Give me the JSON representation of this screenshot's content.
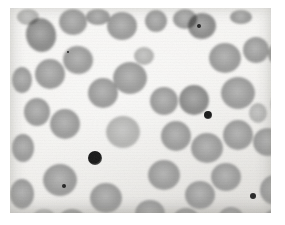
{
  "image": {
    "subject": "peripheral-blood-smear-light-micrograph",
    "modality": "brightfield-light-microscopy",
    "rendering": "grayscale",
    "canvas": {
      "width": 285,
      "height": 225
    },
    "field": {
      "left": 10,
      "top": 8,
      "width": 261,
      "height": 205
    },
    "background_color": "#f6f5f3",
    "matte_color": "#ffffff",
    "cell_fill_color": "#9d9d9c",
    "cell_edge_color": "#8a8a89",
    "pale_cell_color": "#b6b6b4",
    "dark_cell_color": "#8d8d8c",
    "platelet_color": "#161616",
    "counts": {
      "erythrocytes": 44,
      "platelets": 2,
      "specks": 3
    },
    "erythrocytes": [
      {
        "cx": 31,
        "cy": 27,
        "rx": 15,
        "ry": 17,
        "rot": -12,
        "tone": "dark",
        "id": "rbc-01"
      },
      {
        "cx": 63,
        "cy": 14,
        "rx": 14,
        "ry": 13,
        "rot": 5,
        "tone": "mid",
        "id": "rbc-02"
      },
      {
        "cx": 112,
        "cy": 18,
        "rx": 15,
        "ry": 14,
        "rot": 0,
        "tone": "mid",
        "id": "rbc-03"
      },
      {
        "cx": 146,
        "cy": 13,
        "rx": 11,
        "ry": 11,
        "rot": 0,
        "tone": "mid",
        "id": "rbc-04"
      },
      {
        "cx": 175,
        "cy": 11,
        "rx": 12,
        "ry": 10,
        "rot": 0,
        "tone": "mid",
        "id": "rbc-05"
      },
      {
        "cx": 192,
        "cy": 18,
        "rx": 14,
        "ry": 13,
        "rot": -8,
        "tone": "dark",
        "id": "rbc-06"
      },
      {
        "cx": 68,
        "cy": 52,
        "rx": 15,
        "ry": 14,
        "rot": 10,
        "tone": "mid",
        "id": "rbc-07"
      },
      {
        "cx": 40,
        "cy": 66,
        "rx": 15,
        "ry": 15,
        "rot": 0,
        "tone": "mid",
        "id": "rbc-08"
      },
      {
        "cx": 12,
        "cy": 72,
        "rx": 10,
        "ry": 13,
        "rot": 0,
        "tone": "mid",
        "id": "rbc-09"
      },
      {
        "cx": 120,
        "cy": 70,
        "rx": 17,
        "ry": 16,
        "rot": 0,
        "tone": "mid",
        "id": "rbc-10"
      },
      {
        "cx": 93,
        "cy": 85,
        "rx": 15,
        "ry": 15,
        "rot": 0,
        "tone": "mid",
        "id": "rbc-11"
      },
      {
        "cx": 154,
        "cy": 93,
        "rx": 14,
        "ry": 14,
        "rot": 0,
        "tone": "mid",
        "id": "rbc-12"
      },
      {
        "cx": 184,
        "cy": 92,
        "rx": 15,
        "ry": 15,
        "rot": 0,
        "tone": "dark",
        "id": "rbc-13"
      },
      {
        "cx": 215,
        "cy": 50,
        "rx": 16,
        "ry": 15,
        "rot": 0,
        "tone": "mid",
        "id": "rbc-14"
      },
      {
        "cx": 246,
        "cy": 42,
        "rx": 13,
        "ry": 13,
        "rot": 0,
        "tone": "mid",
        "id": "rbc-15"
      },
      {
        "cx": 270,
        "cy": 46,
        "rx": 12,
        "ry": 12,
        "rot": 0,
        "tone": "mid",
        "id": "rbc-16"
      },
      {
        "cx": 228,
        "cy": 85,
        "rx": 17,
        "ry": 16,
        "rot": 0,
        "tone": "mid",
        "id": "rbc-17"
      },
      {
        "cx": 55,
        "cy": 116,
        "rx": 15,
        "ry": 15,
        "rot": 0,
        "tone": "mid",
        "id": "rbc-18"
      },
      {
        "cx": 27,
        "cy": 104,
        "rx": 13,
        "ry": 14,
        "rot": 0,
        "tone": "mid",
        "id": "rbc-19"
      },
      {
        "cx": 113,
        "cy": 124,
        "rx": 17,
        "ry": 16,
        "rot": 0,
        "tone": "pale",
        "id": "rbc-20"
      },
      {
        "cx": 166,
        "cy": 128,
        "rx": 15,
        "ry": 15,
        "rot": 0,
        "tone": "mid",
        "id": "rbc-21"
      },
      {
        "cx": 197,
        "cy": 140,
        "rx": 16,
        "ry": 15,
        "rot": 0,
        "tone": "mid",
        "id": "rbc-22"
      },
      {
        "cx": 228,
        "cy": 127,
        "rx": 15,
        "ry": 15,
        "rot": 0,
        "tone": "mid",
        "id": "rbc-23"
      },
      {
        "cx": 258,
        "cy": 134,
        "rx": 15,
        "ry": 14,
        "rot": 0,
        "tone": "mid",
        "id": "rbc-24"
      },
      {
        "cx": 13,
        "cy": 140,
        "rx": 11,
        "ry": 14,
        "rot": 0,
        "tone": "mid",
        "id": "rbc-25"
      },
      {
        "cx": 50,
        "cy": 172,
        "rx": 17,
        "ry": 16,
        "rot": 0,
        "tone": "mid",
        "id": "rbc-26"
      },
      {
        "cx": 12,
        "cy": 186,
        "rx": 12,
        "ry": 15,
        "rot": 0,
        "tone": "mid",
        "id": "rbc-27"
      },
      {
        "cx": 96,
        "cy": 190,
        "rx": 16,
        "ry": 15,
        "rot": 0,
        "tone": "mid",
        "id": "rbc-28"
      },
      {
        "cx": 140,
        "cy": 206,
        "rx": 15,
        "ry": 14,
        "rot": 0,
        "tone": "mid",
        "id": "rbc-29"
      },
      {
        "cx": 154,
        "cy": 167,
        "rx": 16,
        "ry": 15,
        "rot": 0,
        "tone": "mid",
        "id": "rbc-30"
      },
      {
        "cx": 190,
        "cy": 187,
        "rx": 15,
        "ry": 14,
        "rot": 0,
        "tone": "mid",
        "id": "rbc-31"
      },
      {
        "cx": 176,
        "cy": 213,
        "rx": 14,
        "ry": 13,
        "rot": 0,
        "tone": "mid",
        "id": "rbc-32"
      },
      {
        "cx": 216,
        "cy": 169,
        "rx": 15,
        "ry": 14,
        "rot": 0,
        "tone": "mid",
        "id": "rbc-33"
      },
      {
        "cx": 265,
        "cy": 182,
        "rx": 15,
        "ry": 15,
        "rot": 0,
        "tone": "mid",
        "id": "rbc-34"
      },
      {
        "cx": 271,
        "cy": 96,
        "rx": 10,
        "ry": 13,
        "rot": 0,
        "tone": "mid",
        "id": "rbc-35"
      },
      {
        "cx": 266,
        "cy": 213,
        "rx": 13,
        "ry": 12,
        "rot": 0,
        "tone": "mid",
        "id": "rbc-36"
      },
      {
        "cx": 221,
        "cy": 211,
        "rx": 13,
        "ry": 12,
        "rot": 0,
        "tone": "mid",
        "id": "rbc-37"
      },
      {
        "cx": 62,
        "cy": 213,
        "rx": 14,
        "ry": 12,
        "rot": 0,
        "tone": "mid",
        "id": "rbc-38"
      },
      {
        "cx": 18,
        "cy": 9,
        "rx": 11,
        "ry": 8,
        "rot": 0,
        "tone": "pale",
        "id": "rbc-39"
      },
      {
        "cx": 88,
        "cy": 9,
        "rx": 12,
        "ry": 8,
        "rot": 0,
        "tone": "mid",
        "id": "rbc-40"
      },
      {
        "cx": 231,
        "cy": 9,
        "rx": 11,
        "ry": 7,
        "rot": 0,
        "tone": "mid",
        "id": "rbc-41"
      },
      {
        "cx": 34,
        "cy": 209,
        "rx": 11,
        "ry": 8,
        "rot": 0,
        "tone": "pale",
        "id": "rbc-42"
      },
      {
        "cx": 134,
        "cy": 48,
        "rx": 10,
        "ry": 9,
        "rot": 0,
        "tone": "pale",
        "id": "rbc-43"
      },
      {
        "cx": 248,
        "cy": 105,
        "rx": 9,
        "ry": 10,
        "rot": 0,
        "tone": "pale",
        "id": "rbc-44"
      }
    ],
    "platelets": [
      {
        "cx": 85,
        "cy": 150,
        "r": 7,
        "label": "platelet-clump-central",
        "id": "plt-01"
      },
      {
        "cx": 198,
        "cy": 107,
        "r": 4,
        "label": "platelet-right-upper",
        "id": "plt-02"
      }
    ],
    "specks": [
      {
        "cx": 243,
        "cy": 188,
        "r": 3,
        "label": "debris-speck-lower-right",
        "id": "spk-01"
      },
      {
        "cx": 54,
        "cy": 178,
        "r": 2,
        "label": "inclusion-speck-left",
        "id": "spk-02"
      },
      {
        "cx": 189,
        "cy": 18,
        "r": 2,
        "label": "inclusion-speck-top",
        "id": "spk-03"
      },
      {
        "cx": 58,
        "cy": 44,
        "r": 1,
        "label": "dust-speck-upper-left",
        "id": "spk-04"
      }
    ]
  }
}
